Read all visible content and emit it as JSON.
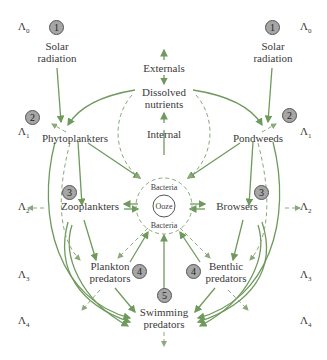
{
  "diagram": {
    "type": "trophic-food-web",
    "colors": {
      "arrow": "#6f9a5c",
      "dashed": "#8aa97c",
      "badge_fill": "#a6a6a6",
      "text": "#3a3a3a"
    },
    "levels": {
      "left": [
        {
          "sym": "Λ",
          "sub": "0"
        },
        {
          "sym": "Λ",
          "sub": "1"
        },
        {
          "sym": "Λ",
          "sub": "2"
        },
        {
          "sym": "Λ",
          "sub": "3"
        },
        {
          "sym": "Λ",
          "sub": "4"
        }
      ],
      "right": [
        {
          "sym": "Λ",
          "sub": "0"
        },
        {
          "sym": "Λ",
          "sub": "1"
        },
        {
          "sym": "Λ",
          "sub": "2"
        },
        {
          "sym": "Λ",
          "sub": "3"
        },
        {
          "sym": "Λ",
          "sub": "4"
        }
      ]
    },
    "nodes": {
      "solar_left": {
        "line1": "Solar",
        "line2": "radiation",
        "badge": "1"
      },
      "solar_right": {
        "line1": "Solar",
        "line2": "radiation",
        "badge": "1"
      },
      "externals": "Externals",
      "dissolved": {
        "line1": "Dissolved",
        "line2": "nutrients"
      },
      "internal": "Internal",
      "phytoplankters": {
        "label": "Phytoplankters",
        "badge": "2"
      },
      "pondweeds": {
        "label": "Pondweeds",
        "badge": "2"
      },
      "zooplankters": {
        "label": "Zooplankters",
        "badge": "3"
      },
      "browsers": {
        "label": "Browsers",
        "badge": "3"
      },
      "bacteria_top": "Bacteria",
      "ooze": "Ooze",
      "bacteria_bottom": "Bacteria",
      "plankton_predators": {
        "line1": "Plankton",
        "line2": "predators",
        "badge": "4"
      },
      "benthic_predators": {
        "line1": "Benthic",
        "line2": "predators",
        "badge": "4"
      },
      "swimming_predators": {
        "line1": "Swimming",
        "line2": "predators",
        "badge": "5"
      }
    }
  }
}
